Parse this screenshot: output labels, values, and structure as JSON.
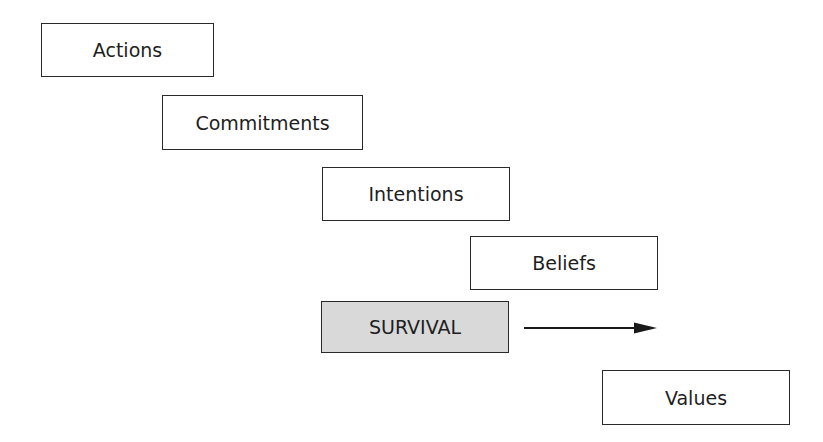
{
  "diagram": {
    "type": "staircase-flow",
    "boxes": [
      {
        "id": "actions",
        "label": "Actions",
        "x": 41,
        "y": 23,
        "w": 173,
        "h": 54,
        "highlight": false
      },
      {
        "id": "commitments",
        "label": "Commitments",
        "x": 162,
        "y": 95,
        "w": 201,
        "h": 55,
        "highlight": false
      },
      {
        "id": "intentions",
        "label": "Intentions",
        "x": 322,
        "y": 167,
        "w": 188,
        "h": 54,
        "highlight": false
      },
      {
        "id": "beliefs",
        "label": "Beliefs",
        "x": 470,
        "y": 236,
        "w": 188,
        "h": 54,
        "highlight": false
      },
      {
        "id": "survival",
        "label": "SURVIVAL",
        "x": 321,
        "y": 301,
        "w": 188,
        "h": 52,
        "highlight": true
      },
      {
        "id": "values",
        "label": "Values",
        "x": 602,
        "y": 370,
        "w": 188,
        "h": 55,
        "highlight": false
      }
    ],
    "arrow": {
      "from": "survival",
      "direction": "right",
      "x1": 524,
      "x2": 656,
      "y": 327
    },
    "colors": {
      "border": "#2a2a2a",
      "highlight_fill": "#d9d9d9",
      "text": "#1e1e1e",
      "background": "#ffffff"
    }
  }
}
